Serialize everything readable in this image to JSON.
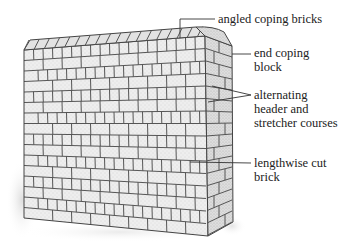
{
  "diagram": {
    "title_cropped": "",
    "colors": {
      "background": "#ffffff",
      "brick_face": "#ececec",
      "brick_face_dark": "#d6d6d6",
      "mortar": "#555555",
      "end_face": "#dcdcdc",
      "shadow": "#e8e8e8",
      "leader": "#333333",
      "label_text": "#222222"
    },
    "labels": [
      {
        "id": "angled-coping-bricks",
        "lines": [
          "angled coping bricks"
        ]
      },
      {
        "id": "end-coping-block",
        "lines": [
          "end coping",
          "block"
        ]
      },
      {
        "id": "alternating-courses",
        "lines": [
          "alternating",
          "header and",
          "stretcher courses"
        ]
      },
      {
        "id": "lengthwise-cut-brick",
        "lines": [
          "lengthwise cut",
          "brick"
        ]
      }
    ]
  }
}
